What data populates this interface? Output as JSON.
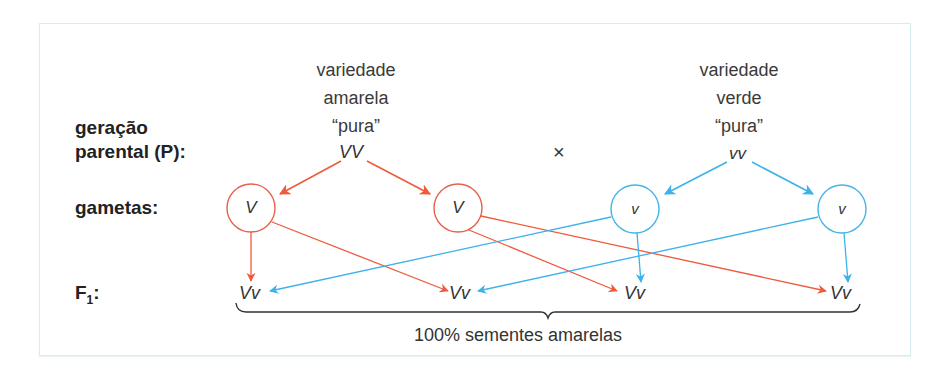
{
  "rows": {
    "parental_line1": "geração",
    "parental_line2": "parental (P):",
    "gametes": "gametas:",
    "f1_letter": "F",
    "f1_sub": "1",
    "f1_colon": ":"
  },
  "parents": {
    "yellow": {
      "line1": "variedade",
      "line2": "amarela",
      "line3": "“pura”",
      "genotype": "VV"
    },
    "green": {
      "line1": "variedade",
      "line2": "verde",
      "line3": "“pura”",
      "genotype": "vv"
    },
    "cross_symbol": "×"
  },
  "gametes": [
    {
      "allele": "V",
      "color": "#e8604a"
    },
    {
      "allele": "V",
      "color": "#e8604a"
    },
    {
      "allele": "v",
      "color": "#45b4e6"
    },
    {
      "allele": "v",
      "color": "#45b4e6"
    }
  ],
  "f1": [
    "Vv",
    "Vv",
    "Vv",
    "Vv"
  ],
  "summary": "100% sementes amarelas",
  "colors": {
    "red": "#ef5a3c",
    "blue": "#3db2ea",
    "border": "#d5eef0"
  }
}
